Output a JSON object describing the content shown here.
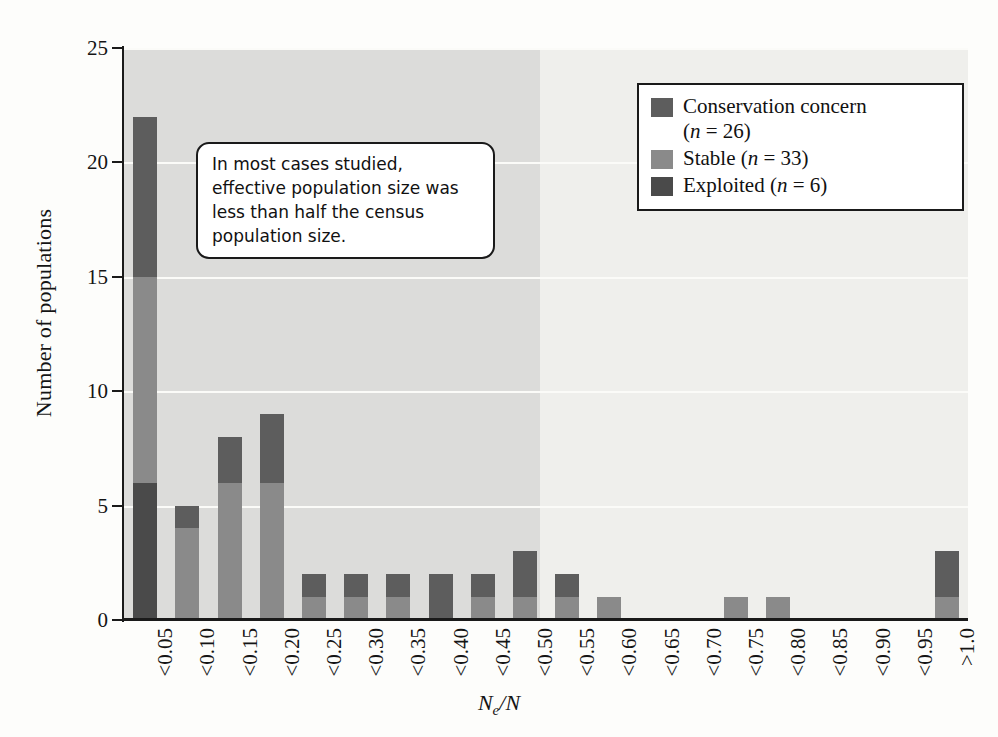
{
  "chart_data": {
    "type": "bar",
    "subtype": "stacked-bar histogram",
    "title": "",
    "xlabel": "Ne/N",
    "ylabel": "Number of populations",
    "ylim": [
      0,
      25
    ],
    "yticks": [
      0,
      5,
      10,
      15,
      20,
      25
    ],
    "grid": "horizontal",
    "legend_position": "top-right",
    "categories": [
      "<0.05",
      "<0.10",
      "<0.15",
      "<0.20",
      "<0.25",
      "<0.30",
      "<0.35",
      "<0.40",
      "<0.45",
      "<0.50",
      "<0.55",
      "<0.60",
      "<0.65",
      "<0.70",
      "<0.75",
      "<0.80",
      "<0.85",
      "<0.90",
      "<0.95",
      ">1.0"
    ],
    "series": [
      {
        "name": "Conservation concern",
        "n": 26,
        "color": "#5d5d5d",
        "values": [
          7,
          1,
          2,
          3,
          1,
          1,
          1,
          2,
          1,
          2,
          1,
          0,
          0,
          0,
          0,
          0,
          0,
          0,
          0,
          2
        ]
      },
      {
        "name": "Stable",
        "n": 33,
        "color": "#8a8a8a",
        "values": [
          9,
          4,
          6,
          6,
          1,
          1,
          1,
          0,
          1,
          1,
          1,
          1,
          0,
          0,
          1,
          1,
          0,
          0,
          0,
          1
        ]
      },
      {
        "name": "Exploited",
        "n": 6,
        "color": "#4a4a4a",
        "values": [
          6,
          0,
          0,
          0,
          0,
          0,
          0,
          0,
          0,
          0,
          0,
          0,
          0,
          0,
          0,
          0,
          0,
          0,
          0,
          0
        ]
      }
    ],
    "totals": [
      22,
      5,
      8,
      9,
      2,
      2,
      2,
      2,
      2,
      3,
      2,
      1,
      0,
      0,
      1,
      1,
      0,
      0,
      0,
      3
    ],
    "shaded_region": {
      "from": "<0.05",
      "to": "<0.50",
      "meaning": "Ne/N less than half the census population size"
    }
  },
  "legend": {
    "items": [
      {
        "label": "Conservation concern",
        "n_text": "(n = 26)",
        "swatch": "#5d5d5d"
      },
      {
        "label": "Stable",
        "n_text": "(n = 33)",
        "swatch": "#8a8a8a"
      },
      {
        "label": "Exploited",
        "n_text": "(n = 6)",
        "swatch": "#4a4a4a"
      }
    ]
  },
  "callout": {
    "text": "In most cases studied, effective population size was less than half the census population size."
  },
  "axes": {
    "y_title": "Number of populations",
    "y_tick_labels": [
      "0",
      "5",
      "10",
      "15",
      "20",
      "25"
    ],
    "x_title_main": "N",
    "x_title_sub": "e",
    "x_title_rest": "/N"
  }
}
